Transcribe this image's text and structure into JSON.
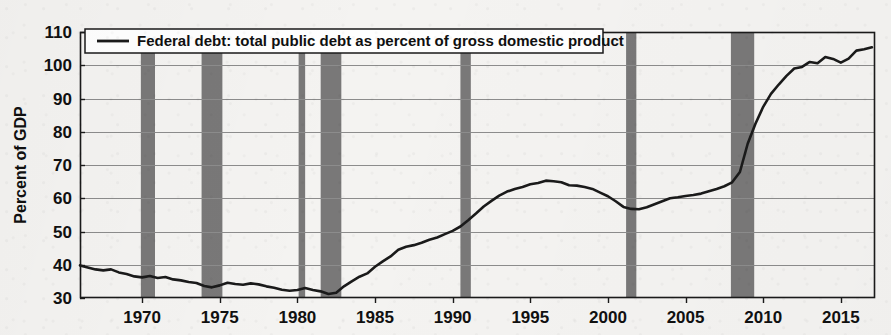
{
  "figure": {
    "background_color": "#f4f3f1",
    "ink_color": "#1a1a1a",
    "recession_color": "#6e6e6e",
    "gridline_color": "#8c8c8c"
  },
  "legend": {
    "position": "top-left-inside",
    "entries": [
      {
        "label": "Federal debt: total public debt as percent of gross domestic product",
        "marker": "line",
        "color": "#1a1a1a"
      }
    ]
  },
  "axes": {
    "y": {
      "title": "Percent of GDP",
      "ticks": [
        "30",
        "40",
        "50",
        "60",
        "70",
        "80",
        "90",
        "100",
        "110"
      ],
      "min": 30,
      "max": 110,
      "step": 10
    },
    "x": {
      "title": "",
      "ticks": [
        "1970",
        "1975",
        "1980",
        "1985",
        "1990",
        "1995",
        "2000",
        "2005",
        "2010",
        "2015"
      ],
      "min": 1966.0,
      "max": 2017.2,
      "step": 5
    }
  },
  "chart_data": {
    "type": "line",
    "title": "",
    "subtitle": "",
    "xlabel": "",
    "ylabel": "Percent of GDP",
    "xlim": [
      1966.0,
      2017.2
    ],
    "ylim": [
      30,
      110
    ],
    "grid": true,
    "legend_position": "top-left",
    "series": [
      {
        "name": "Federal debt: total public debt as percent of gross domestic product",
        "color": "#1a1a1a",
        "x": [
          1966.0,
          1966.5,
          1967.0,
          1967.5,
          1968.0,
          1968.5,
          1969.0,
          1969.5,
          1970.0,
          1970.5,
          1971.0,
          1971.5,
          1972.0,
          1972.5,
          1973.0,
          1973.5,
          1974.0,
          1974.5,
          1975.0,
          1975.5,
          1976.0,
          1976.5,
          1977.0,
          1977.5,
          1978.0,
          1978.5,
          1979.0,
          1979.5,
          1980.0,
          1980.5,
          1981.0,
          1981.5,
          1982.0,
          1982.5,
          1983.0,
          1983.5,
          1984.0,
          1984.5,
          1985.0,
          1985.5,
          1986.0,
          1986.5,
          1987.0,
          1987.5,
          1988.0,
          1988.5,
          1989.0,
          1989.5,
          1990.0,
          1990.5,
          1991.0,
          1991.5,
          1992.0,
          1992.5,
          1993.0,
          1993.5,
          1994.0,
          1994.5,
          1995.0,
          1995.5,
          1996.0,
          1996.5,
          1997.0,
          1997.5,
          1998.0,
          1998.5,
          1999.0,
          1999.5,
          2000.0,
          2000.5,
          2001.0,
          2001.5,
          2002.0,
          2002.5,
          2003.0,
          2003.5,
          2004.0,
          2004.5,
          2005.0,
          2005.5,
          2006.0,
          2006.5,
          2007.0,
          2007.5,
          2008.0,
          2008.5,
          2009.0,
          2009.5,
          2010.0,
          2010.5,
          2011.0,
          2011.5,
          2012.0,
          2012.5,
          2013.0,
          2013.5,
          2014.0,
          2014.5,
          2015.0,
          2015.5,
          2016.0,
          2016.5,
          2017.0
        ],
        "y": [
          39.8,
          39.2,
          38.6,
          38.3,
          38.6,
          37.7,
          37.2,
          36.5,
          36.2,
          36.6,
          36.0,
          36.3,
          35.6,
          35.3,
          34.8,
          34.5,
          33.6,
          33.2,
          33.8,
          34.6,
          34.2,
          34.0,
          34.4,
          34.1,
          33.5,
          33.1,
          32.5,
          32.2,
          32.4,
          33.0,
          32.4,
          32.0,
          31.2,
          31.6,
          33.5,
          35.0,
          36.4,
          37.4,
          39.4,
          41.0,
          42.5,
          44.5,
          45.4,
          45.9,
          46.6,
          47.5,
          48.2,
          49.2,
          50.2,
          51.5,
          53.4,
          55.4,
          57.5,
          59.2,
          60.8,
          62.0,
          62.8,
          63.4,
          64.2,
          64.6,
          65.3,
          65.1,
          64.8,
          63.9,
          63.8,
          63.4,
          62.8,
          61.7,
          60.6,
          59.1,
          57.4,
          56.8,
          56.7,
          57.3,
          58.2,
          59.1,
          60.0,
          60.3,
          60.7,
          61.0,
          61.4,
          62.1,
          62.8,
          63.6,
          64.8,
          67.9,
          76.4,
          82.4,
          87.5,
          91.4,
          94.2,
          96.8,
          99.0,
          99.5,
          101.0,
          100.6,
          102.5,
          101.9,
          100.8,
          102.0,
          104.4,
          104.8,
          105.4
        ]
      }
    ],
    "recession_bands": [
      {
        "label": "1969-70 recession",
        "start": 1969.92,
        "end": 1970.83
      },
      {
        "label": "1973-75 recession",
        "start": 1973.83,
        "end": 1975.17
      },
      {
        "label": "1980 recession",
        "start": 1980.08,
        "end": 1980.5
      },
      {
        "label": "1981-82 recession",
        "start": 1981.5,
        "end": 1982.83
      },
      {
        "label": "1990-91 recession",
        "start": 1990.5,
        "end": 1991.17
      },
      {
        "label": "2001 recession",
        "start": 2001.17,
        "end": 2001.83
      },
      {
        "label": "2007-09 recession",
        "start": 2007.92,
        "end": 2009.42
      }
    ]
  }
}
